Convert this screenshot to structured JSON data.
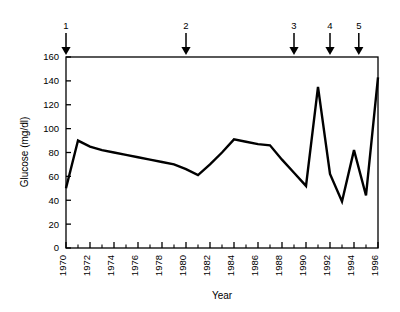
{
  "chart_data": {
    "type": "line",
    "title": "",
    "xlabel": "Year",
    "ylabel": "Glucose (mg/dl)",
    "xlim": [
      1970,
      1996
    ],
    "ylim": [
      0,
      160
    ],
    "grid": false,
    "legend": "none",
    "x": [
      1970,
      1971,
      1972,
      1973,
      1974,
      1975,
      1976,
      1977,
      1978,
      1979,
      1980,
      1981,
      1982,
      1983,
      1984,
      1985,
      1986,
      1987,
      1988,
      1989,
      1990,
      1991,
      1992,
      1993,
      1994,
      1995,
      1996
    ],
    "values": [
      50,
      90,
      85,
      82,
      80,
      78,
      76,
      74,
      72,
      70,
      66,
      61,
      70,
      80,
      91,
      89,
      87,
      86,
      74,
      63,
      52,
      135,
      62,
      39,
      82,
      44,
      143
    ],
    "series": [
      {
        "name": "Glucose",
        "values": [
          50,
          90,
          85,
          82,
          80,
          78,
          76,
          74,
          72,
          70,
          66,
          61,
          70,
          80,
          91,
          89,
          87,
          86,
          74,
          63,
          52,
          135,
          62,
          39,
          82,
          44,
          143
        ],
        "color": "#000000"
      }
    ],
    "ytick_labels": [
      "0",
      "20",
      "40",
      "60",
      "80",
      "100",
      "120",
      "140",
      "160"
    ],
    "ytick_values": [
      0,
      20,
      40,
      60,
      80,
      100,
      120,
      140,
      160
    ],
    "xtick_labels": [
      "1970",
      "1972",
      "1974",
      "1976",
      "1978",
      "1980",
      "1982",
      "1984",
      "1986",
      "1988",
      "1990",
      "1992",
      "1994",
      "1996"
    ],
    "xtick_values": [
      1970,
      1972,
      1974,
      1976,
      1978,
      1980,
      1982,
      1984,
      1986,
      1988,
      1990,
      1992,
      1994,
      1996
    ],
    "xminor_values": [
      1971,
      1973,
      1975,
      1977,
      1979,
      1981,
      1983,
      1985,
      1987,
      1989,
      1991,
      1993,
      1995
    ],
    "annotations": [
      {
        "label": "1",
        "year": 1970
      },
      {
        "label": "2",
        "year": 1980
      },
      {
        "label": "3",
        "year": 1989
      },
      {
        "label": "4",
        "year": 1992
      },
      {
        "label": "5",
        "year": 1994.4
      }
    ]
  },
  "axis": {
    "line_color": "#000000",
    "plot_background": "#ffffff"
  }
}
